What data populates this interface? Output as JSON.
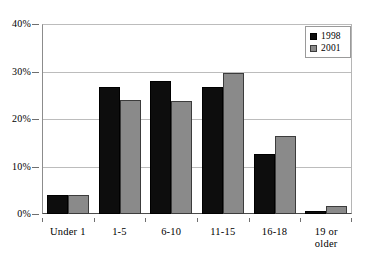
{
  "chart_data": {
    "type": "bar",
    "title": "",
    "subtitle": "",
    "xlabel": "",
    "ylabel": "",
    "categories": [
      "Under 1",
      "1-5",
      "6-10",
      "11-15",
      "16-18",
      "19 or\nolder"
    ],
    "series": [
      {
        "name": "1998",
        "color": "#0d0d0d",
        "values": [
          4.0,
          26.8,
          27.9,
          26.7,
          12.6,
          0.7
        ]
      },
      {
        "name": "2001",
        "color": "#8a8a8a",
        "values": [
          4.0,
          23.9,
          23.8,
          29.7,
          16.5,
          1.7
        ]
      }
    ],
    "ylim": [
      0,
      40
    ],
    "ytick_values": [
      0,
      10,
      20,
      30,
      40
    ],
    "ytick_labels": [
      "0%",
      "10%",
      "20%",
      "30%",
      "40%"
    ],
    "grid": true,
    "legend_position": "top-right"
  },
  "legend": {
    "entries": [
      {
        "label": "1998"
      },
      {
        "label": "2001"
      }
    ]
  }
}
